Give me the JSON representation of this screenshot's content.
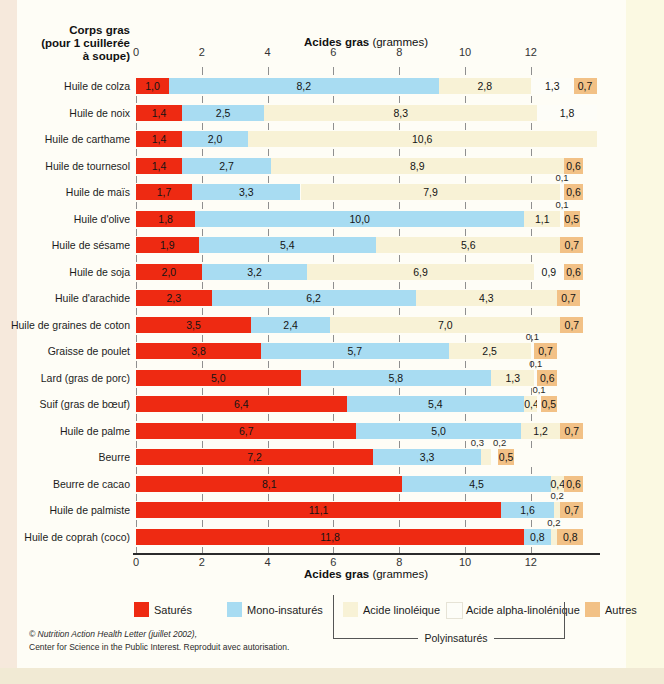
{
  "page": {
    "left_header_line1": "Corps gras",
    "left_header_line2": "(pour 1 cuillerée",
    "left_header_line3": "à soupe)",
    "axis_title_bold": "Acides gras",
    "axis_title_normal": " (grammes)",
    "footer_line1": "© Nutrition Action Health Letter (juillet 2002),",
    "footer_line2": "Center for Science in the Public Interest. Reproduit avec autorisation."
  },
  "legend": {
    "items": [
      {
        "key": "sat",
        "label": "Saturés",
        "color": "#ee2a12"
      },
      {
        "key": "mono",
        "label": "Mono-insaturés",
        "color": "#a8dcf2"
      },
      {
        "key": "lin",
        "label": "Acide linoléique",
        "color": "#f8f2d6"
      },
      {
        "key": "ala",
        "label": "Acide alpha-linolénique",
        "color": "#fdfdf8"
      },
      {
        "key": "autres",
        "label": "Autres",
        "color": "#f2c186"
      }
    ],
    "poly_label": "Polyinsaturés"
  },
  "chart_data": {
    "type": "bar",
    "orientation": "horizontal",
    "stacked": true,
    "title": "Acides gras (grammes)",
    "xlabel": "Acides gras (grammes)",
    "ylabel": "Corps gras (pour 1 cuillerée à soupe)",
    "xlim": [
      0,
      14
    ],
    "x_ticks": [
      0,
      2,
      4,
      6,
      8,
      10,
      12
    ],
    "grid": "dashed-vertical",
    "legend_position": "bottom",
    "series_names": {
      "sat": "Saturés",
      "mono": "Mono-insaturés",
      "lin": "Acide linoléique",
      "ala": "Acide alpha-linolénique",
      "autres": "Autres"
    },
    "rows": [
      {
        "label": "Huile de colza",
        "segments": [
          {
            "k": "sat",
            "v": 1.0,
            "t": "1,0"
          },
          {
            "k": "mono",
            "v": 8.2,
            "t": "8,2"
          },
          {
            "k": "lin",
            "v": 2.8,
            "t": "2,8"
          },
          {
            "k": "ala",
            "v": 1.3,
            "t": "1,3"
          },
          {
            "k": "autres",
            "v": 0.7,
            "t": "0,7"
          }
        ]
      },
      {
        "label": "Huile de noix",
        "segments": [
          {
            "k": "sat",
            "v": 1.4,
            "t": "1,4"
          },
          {
            "k": "mono",
            "v": 2.5,
            "t": "2,5"
          },
          {
            "k": "lin",
            "v": 8.3,
            "t": "8,3"
          },
          {
            "k": "ala",
            "v": 1.8,
            "t": "1,8"
          }
        ]
      },
      {
        "label": "Huile de carthame",
        "segments": [
          {
            "k": "sat",
            "v": 1.4,
            "t": "1,4"
          },
          {
            "k": "mono",
            "v": 2.0,
            "t": "2,0"
          },
          {
            "k": "lin",
            "v": 10.6,
            "t": "10,6"
          }
        ]
      },
      {
        "label": "Huile de tournesol",
        "segments": [
          {
            "k": "sat",
            "v": 1.4,
            "t": "1,4"
          },
          {
            "k": "mono",
            "v": 2.7,
            "t": "2,7"
          },
          {
            "k": "lin",
            "v": 8.9,
            "t": "8,9"
          },
          {
            "k": "autres",
            "v": 0.6,
            "t": "0,6"
          }
        ]
      },
      {
        "label": "Huile de maïs",
        "segments": [
          {
            "k": "sat",
            "v": 1.7,
            "t": "1,7"
          },
          {
            "k": "mono",
            "v": 3.3,
            "t": "3,3"
          },
          {
            "k": "lin",
            "v": 7.9,
            "t": "7,9"
          },
          {
            "k": "ala",
            "v": 0.1,
            "t": "0,1",
            "pos": "above"
          },
          {
            "k": "autres",
            "v": 0.6,
            "t": "0,6"
          }
        ]
      },
      {
        "label": "Huile d'olive",
        "segments": [
          {
            "k": "sat",
            "v": 1.8,
            "t": "1,8"
          },
          {
            "k": "mono",
            "v": 10.0,
            "t": "10,0"
          },
          {
            "k": "lin",
            "v": 1.1,
            "t": "1,1"
          },
          {
            "k": "ala",
            "v": 0.1,
            "t": "0,1",
            "pos": "above"
          },
          {
            "k": "autres",
            "v": 0.5,
            "t": "0,5"
          }
        ]
      },
      {
        "label": "Huile de sésame",
        "segments": [
          {
            "k": "sat",
            "v": 1.9,
            "t": "1,9"
          },
          {
            "k": "mono",
            "v": 5.4,
            "t": "5,4"
          },
          {
            "k": "lin",
            "v": 5.6,
            "t": "5,6"
          },
          {
            "k": "autres",
            "v": 0.7,
            "t": "0,7"
          }
        ]
      },
      {
        "label": "Huile de soja",
        "segments": [
          {
            "k": "sat",
            "v": 2.0,
            "t": "2,0"
          },
          {
            "k": "mono",
            "v": 3.2,
            "t": "3,2"
          },
          {
            "k": "lin",
            "v": 6.9,
            "t": "6,9"
          },
          {
            "k": "ala",
            "v": 0.9,
            "t": "0,9"
          },
          {
            "k": "autres",
            "v": 0.6,
            "t": "0,6"
          }
        ]
      },
      {
        "label": "Huile d'arachide",
        "segments": [
          {
            "k": "sat",
            "v": 2.3,
            "t": "2,3"
          },
          {
            "k": "mono",
            "v": 6.2,
            "t": "6,2"
          },
          {
            "k": "lin",
            "v": 4.3,
            "t": "4,3"
          },
          {
            "k": "autres",
            "v": 0.7,
            "t": "0,7"
          }
        ]
      },
      {
        "label": "Huile de graines de coton",
        "segments": [
          {
            "k": "sat",
            "v": 3.5,
            "t": "3,5"
          },
          {
            "k": "mono",
            "v": 2.4,
            "t": "2,4"
          },
          {
            "k": "lin",
            "v": 7.0,
            "t": "7,0"
          },
          {
            "k": "autres",
            "v": 0.7,
            "t": "0,7"
          }
        ]
      },
      {
        "label": "Graisse de poulet",
        "segments": [
          {
            "k": "sat",
            "v": 3.8,
            "t": "3,8"
          },
          {
            "k": "mono",
            "v": 5.7,
            "t": "5,7"
          },
          {
            "k": "lin",
            "v": 2.5,
            "t": "2,5"
          },
          {
            "k": "ala",
            "v": 0.1,
            "t": "0,1",
            "pos": "above"
          },
          {
            "k": "autres",
            "v": 0.7,
            "t": "0,7"
          }
        ]
      },
      {
        "label": "Lard (gras de porc)",
        "segments": [
          {
            "k": "sat",
            "v": 5.0,
            "t": "5,0"
          },
          {
            "k": "mono",
            "v": 5.8,
            "t": "5,8"
          },
          {
            "k": "lin",
            "v": 1.3,
            "t": "1,3"
          },
          {
            "k": "ala",
            "v": 0.1,
            "t": "0,1",
            "pos": "above"
          },
          {
            "k": "autres",
            "v": 0.6,
            "t": "0,6"
          }
        ]
      },
      {
        "label": "Suif (gras de bœuf)",
        "segments": [
          {
            "k": "sat",
            "v": 6.4,
            "t": "6,4"
          },
          {
            "k": "mono",
            "v": 5.4,
            "t": "5,4"
          },
          {
            "k": "lin",
            "v": 0.4,
            "t": "0,4"
          },
          {
            "k": "ala",
            "v": 0.1,
            "t": "0,1",
            "pos": "above"
          },
          {
            "k": "autres",
            "v": 0.5,
            "t": "0,5"
          }
        ]
      },
      {
        "label": "Huile de palme",
        "segments": [
          {
            "k": "sat",
            "v": 6.7,
            "t": "6,7"
          },
          {
            "k": "mono",
            "v": 5.0,
            "t": "5,0"
          },
          {
            "k": "lin",
            "v": 1.2,
            "t": "1,2"
          },
          {
            "k": "autres",
            "v": 0.7,
            "t": "0,7"
          }
        ]
      },
      {
        "label": "Beurre",
        "segments": [
          {
            "k": "sat",
            "v": 7.2,
            "t": "7,2"
          },
          {
            "k": "mono",
            "v": 3.3,
            "t": "3,3"
          },
          {
            "k": "lin",
            "v": 0.3,
            "t": "0,3",
            "pos": "above",
            "dx": -9
          },
          {
            "k": "ala",
            "v": 0.2,
            "t": "0,2",
            "pos": "above",
            "dx": 5
          },
          {
            "k": "autres",
            "v": 0.5,
            "t": "0,5"
          }
        ]
      },
      {
        "label": "Beurre de cacao",
        "segments": [
          {
            "k": "sat",
            "v": 8.1,
            "t": "8,1"
          },
          {
            "k": "mono",
            "v": 4.5,
            "t": "4,5"
          },
          {
            "k": "lin",
            "v": 0.4,
            "t": "0,4"
          },
          {
            "k": "autres",
            "v": 0.6,
            "t": "0,6"
          }
        ]
      },
      {
        "label": "Huile de palmiste",
        "segments": [
          {
            "k": "sat",
            "v": 11.1,
            "t": "11,1"
          },
          {
            "k": "mono",
            "v": 1.6,
            "t": "1,6"
          },
          {
            "k": "lin",
            "v": 0.2,
            "t": "0,2",
            "pos": "above"
          },
          {
            "k": "autres",
            "v": 0.7,
            "t": "0,7"
          }
        ]
      },
      {
        "label": "Huile de coprah (coco)",
        "segments": [
          {
            "k": "sat",
            "v": 11.8,
            "t": "11,8"
          },
          {
            "k": "mono",
            "v": 0.8,
            "t": "0,8"
          },
          {
            "k": "lin",
            "v": 0.2,
            "t": "0,2",
            "pos": "above"
          },
          {
            "k": "autres",
            "v": 0.8,
            "t": "0,8"
          }
        ]
      }
    ]
  }
}
